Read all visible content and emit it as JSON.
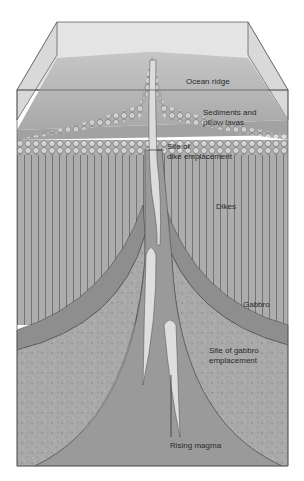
{
  "diagram": {
    "labels": {
      "ocean_ridge": "Ocean ridge",
      "sediments_1": "Sediments and",
      "sediments_2": "pillow lavas",
      "dike_site_1": "Site of",
      "dike_site_2": "dike emplacement",
      "dikes": "Dikes",
      "gabbro": "Gabbro",
      "gabbro_site_1": "Site of gabbro",
      "gabbro_site_2": "emplacement",
      "rising_magma": "Rising magma"
    },
    "colors": {
      "water": "#e4e4e4",
      "seafloor": "#b8b8b8",
      "dikes": "#adadad",
      "gabbro_band": "#8e8e8e",
      "gabbro_speckled": "#a9a9a9",
      "magma_column": "#9a9a9a",
      "magma_pocket": "#dedede",
      "outline": "#4a4a4a"
    }
  }
}
